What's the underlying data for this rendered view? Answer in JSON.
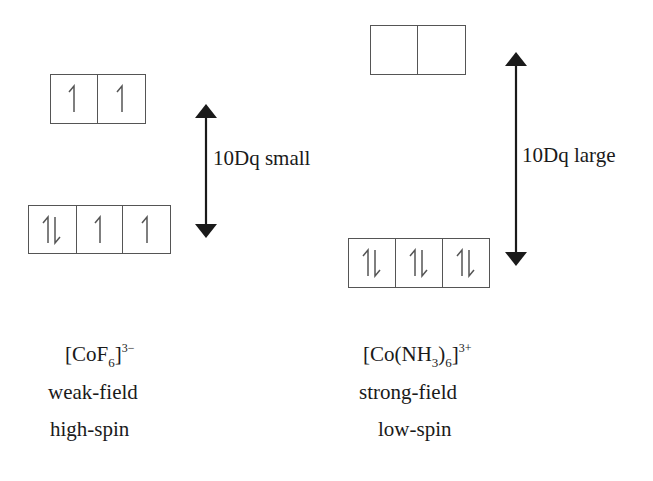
{
  "left": {
    "eg": {
      "orbitals": [
        "up",
        "up"
      ]
    },
    "t2g": {
      "orbitals": [
        "updown",
        "up",
        "up"
      ]
    },
    "gap_label": "10Dq small",
    "complex": {
      "prefix": "[CoF",
      "sub": "6",
      "close": "]",
      "charge": "3−"
    },
    "field": "weak-field",
    "spin": "high-spin"
  },
  "right": {
    "eg": {
      "orbitals": [
        "empty",
        "empty"
      ]
    },
    "t2g": {
      "orbitals": [
        "updown",
        "updown",
        "updown"
      ]
    },
    "gap_label": "10Dq large",
    "complex": {
      "prefix": "[Co(NH",
      "sub1": "3",
      "mid": ")",
      "sub2": "6",
      "close": "]",
      "charge": "3+"
    },
    "field": "strong-field",
    "spin": "low-spin"
  },
  "colors": {
    "line": "#555555",
    "arrow": "#1a1a1a",
    "text": "#1a1a1a"
  }
}
